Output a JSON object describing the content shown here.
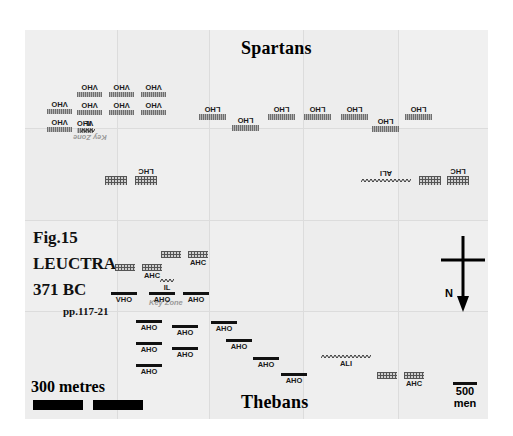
{
  "figure": {
    "caption_line1": "Fig.15",
    "caption_line2": "LEUCTRA",
    "caption_line3": "371 BC",
    "caption_line4": "pp.117-21"
  },
  "armies": {
    "top_label": "Spartans",
    "bottom_label": "Thebans"
  },
  "annotations": {
    "key_zone_top": "Key Zone",
    "key_zone_bottom": "Key Zone"
  },
  "scale": {
    "label": "300 metres"
  },
  "unit_key": {
    "count": "500",
    "unit": "men"
  },
  "compass": {
    "direction": "N"
  },
  "units": {
    "spartan": [
      {
        "id": "sp-vho-1",
        "label": "VHO",
        "type": "hoplite-light",
        "x": 22,
        "y": 67,
        "w": 25,
        "h": 5
      },
      {
        "id": "sp-vho-2",
        "label": "VHO",
        "type": "hoplite-light",
        "x": 22,
        "y": 85,
        "w": 25,
        "h": 5
      },
      {
        "id": "sp-vho-3",
        "label": "VHO",
        "type": "hoplite-light",
        "x": 52,
        "y": 50,
        "w": 25,
        "h": 5
      },
      {
        "id": "sp-vho-4",
        "label": "VHO",
        "type": "hoplite-light",
        "x": 52,
        "y": 68,
        "w": 25,
        "h": 5
      },
      {
        "id": "sp-vho-5",
        "label": "VHO",
        "type": "hoplite-light",
        "x": 52,
        "y": 86,
        "w": 16,
        "h": 5
      },
      {
        "id": "sp-vho-6",
        "label": "VHO",
        "type": "hoplite-light",
        "x": 84,
        "y": 50,
        "w": 25,
        "h": 5
      },
      {
        "id": "sp-vho-7",
        "label": "VHO",
        "type": "hoplite-light",
        "x": 84,
        "y": 68,
        "w": 25,
        "h": 5
      },
      {
        "id": "sp-vho-8",
        "label": "VHO",
        "type": "hoplite-light",
        "x": 116,
        "y": 50,
        "w": 25,
        "h": 5
      },
      {
        "id": "sp-vho-9",
        "label": "VHO",
        "type": "hoplite-light",
        "x": 116,
        "y": 68,
        "w": 25,
        "h": 5
      },
      {
        "id": "sp-il",
        "label": "IL",
        "type": "light",
        "x": 56,
        "y": 86,
        "w": 14,
        "h": 4
      },
      {
        "id": "sp-lho-1",
        "label": "LHO",
        "type": "hoplite-light",
        "x": 174,
        "y": 72,
        "w": 27,
        "h": 6
      },
      {
        "id": "sp-lho-2",
        "label": "LHO",
        "type": "hoplite-light",
        "x": 207,
        "y": 83,
        "w": 27,
        "h": 6
      },
      {
        "id": "sp-lho-3",
        "label": "LHO",
        "type": "hoplite-light",
        "x": 243,
        "y": 72,
        "w": 27,
        "h": 6
      },
      {
        "id": "sp-lho-4",
        "label": "LHO",
        "type": "hoplite-light",
        "x": 279,
        "y": 72,
        "w": 27,
        "h": 6
      },
      {
        "id": "sp-lho-5",
        "label": "LHO",
        "type": "hoplite-light",
        "x": 316,
        "y": 72,
        "w": 27,
        "h": 6
      },
      {
        "id": "sp-lho-6",
        "label": "LHO",
        "type": "hoplite-light",
        "x": 347,
        "y": 84,
        "w": 27,
        "h": 6
      },
      {
        "id": "sp-lho-7",
        "label": "LHO",
        "type": "hoplite-light",
        "x": 380,
        "y": 72,
        "w": 27,
        "h": 6
      },
      {
        "id": "sp-lhc-left-a",
        "label": "",
        "type": "cav",
        "x": 80,
        "y": 134,
        "w": 22,
        "h": 9
      },
      {
        "id": "sp-lhc-left-b",
        "label": "LHC",
        "type": "cav",
        "x": 110,
        "y": 134,
        "w": 22,
        "h": 9
      },
      {
        "id": "sp-ali",
        "label": "ALI",
        "type": "light",
        "x": 336,
        "y": 136,
        "w": 50,
        "h": 4
      },
      {
        "id": "sp-lhc-right-a",
        "label": "",
        "type": "cav",
        "x": 394,
        "y": 134,
        "w": 22,
        "h": 9
      },
      {
        "id": "sp-lhc-right-b",
        "label": "LHC",
        "type": "cav",
        "x": 422,
        "y": 134,
        "w": 22,
        "h": 9
      }
    ],
    "theban": [
      {
        "id": "th-ahc-1a",
        "label": "",
        "type": "cav",
        "x": 90,
        "y": 234,
        "w": 20,
        "h": 7
      },
      {
        "id": "th-ahc-1b",
        "label": "AHC",
        "type": "cav",
        "x": 117,
        "y": 234,
        "w": 20,
        "h": 7
      },
      {
        "id": "th-ahc-2a",
        "label": "",
        "type": "cav",
        "x": 136,
        "y": 221,
        "w": 20,
        "h": 7
      },
      {
        "id": "th-ahc-2b",
        "label": "AHC",
        "type": "cav",
        "x": 163,
        "y": 221,
        "w": 20,
        "h": 7
      },
      {
        "id": "th-il",
        "label": "IL",
        "type": "light",
        "x": 135,
        "y": 249,
        "w": 14,
        "h": 4
      },
      {
        "id": "th-vho",
        "label": "VHO",
        "type": "hoplite-dark",
        "x": 86,
        "y": 262,
        "w": 26,
        "h": 3
      },
      {
        "id": "th-aho-a",
        "label": "AHO",
        "type": "hoplite-dark",
        "x": 124,
        "y": 262,
        "w": 26,
        "h": 3
      },
      {
        "id": "th-aho-b",
        "label": "AHO",
        "type": "hoplite-dark",
        "x": 158,
        "y": 262,
        "w": 26,
        "h": 3
      },
      {
        "id": "th-aho-c",
        "label": "AHO",
        "type": "hoplite-dark",
        "x": 111,
        "y": 290,
        "w": 26,
        "h": 3
      },
      {
        "id": "th-aho-d",
        "label": "AHO",
        "type": "hoplite-dark",
        "x": 147,
        "y": 295,
        "w": 26,
        "h": 3
      },
      {
        "id": "th-aho-e",
        "label": "AHO",
        "type": "hoplite-dark",
        "x": 111,
        "y": 312,
        "w": 26,
        "h": 3
      },
      {
        "id": "th-aho-f",
        "label": "AHO",
        "type": "hoplite-dark",
        "x": 147,
        "y": 317,
        "w": 26,
        "h": 3
      },
      {
        "id": "th-aho-g",
        "label": "AHO",
        "type": "hoplite-dark",
        "x": 111,
        "y": 334,
        "w": 26,
        "h": 3
      },
      {
        "id": "th-aho-h",
        "label": "AHO",
        "type": "hoplite-dark",
        "x": 186,
        "y": 291,
        "w": 26,
        "h": 3
      },
      {
        "id": "th-aho-i",
        "label": "AHO",
        "type": "hoplite-dark",
        "x": 201,
        "y": 309,
        "w": 26,
        "h": 3
      },
      {
        "id": "th-aho-j",
        "label": "AHO",
        "type": "hoplite-dark",
        "x": 228,
        "y": 327,
        "w": 26,
        "h": 3
      },
      {
        "id": "th-aho-k",
        "label": "AHO",
        "type": "hoplite-dark",
        "x": 256,
        "y": 343,
        "w": 26,
        "h": 3
      },
      {
        "id": "th-ali",
        "label": "ALI",
        "type": "light",
        "x": 296,
        "y": 325,
        "w": 50,
        "h": 4
      },
      {
        "id": "th-ahc-3a",
        "label": "",
        "type": "cav",
        "x": 352,
        "y": 342,
        "w": 20,
        "h": 7
      },
      {
        "id": "th-ahc-3b",
        "label": "AHC",
        "type": "cav",
        "x": 379,
        "y": 342,
        "w": 20,
        "h": 7
      }
    ]
  }
}
